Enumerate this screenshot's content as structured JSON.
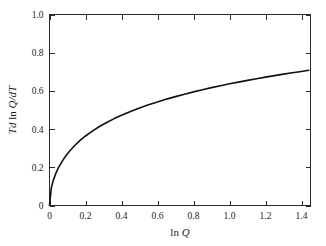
{
  "chart_data": {
    "type": "line",
    "title": "",
    "subtitle": "",
    "xlabel": "ln Q",
    "ylabel": "T d ln Q/dT",
    "xlabel_parts": {
      "roman": "ln ",
      "italic": "Q"
    },
    "ylabel_parts": {
      "italic_1": "T",
      "italic_2": "d",
      "roman": " ln ",
      "italic_3": "Q",
      "italic_4": "/dT"
    },
    "xlim": [
      0,
      1.45
    ],
    "ylim": [
      0,
      1.0
    ],
    "xticks": [
      0,
      0.2,
      0.4,
      0.6,
      0.8,
      1.0,
      1.2,
      1.4
    ],
    "yticks": [
      0,
      0.2,
      0.4,
      0.6,
      0.8,
      1.0
    ],
    "xtick_labels": [
      "0",
      "0.2",
      "0.4",
      "0.6",
      "0.8",
      "1.0",
      "1.2",
      "1.4"
    ],
    "ytick_labels": [
      "0",
      "0.2",
      "0.4",
      "0.6",
      "0.8",
      "1.0"
    ],
    "grid": false,
    "legend": null,
    "legend_position": "none",
    "ticks_direction": "in",
    "frame": "full-box",
    "series": [
      {
        "name": "T d ln Q/dT",
        "color": "#111111",
        "x": [
          0.0,
          0.01,
          0.02,
          0.035,
          0.05,
          0.07,
          0.09,
          0.11,
          0.14,
          0.17,
          0.2,
          0.24,
          0.28,
          0.32,
          0.36,
          0.4,
          0.45,
          0.5,
          0.55,
          0.6,
          0.65,
          0.7,
          0.75,
          0.8,
          0.85,
          0.9,
          0.95,
          1.0,
          1.05,
          1.1,
          1.15,
          1.2,
          1.25,
          1.3,
          1.35,
          1.4,
          1.44
        ],
        "y": [
          0.0,
          0.092,
          0.129,
          0.168,
          0.198,
          0.231,
          0.259,
          0.283,
          0.314,
          0.341,
          0.364,
          0.391,
          0.415,
          0.436,
          0.455,
          0.472,
          0.492,
          0.51,
          0.527,
          0.542,
          0.557,
          0.57,
          0.583,
          0.595,
          0.606,
          0.617,
          0.627,
          0.637,
          0.646,
          0.655,
          0.664,
          0.672,
          0.68,
          0.688,
          0.695,
          0.702,
          0.708
        ]
      }
    ]
  },
  "figure": {
    "background_color": "#ffffff",
    "axis_color": "#2b2b2b",
    "curve_color": "#111111"
  }
}
